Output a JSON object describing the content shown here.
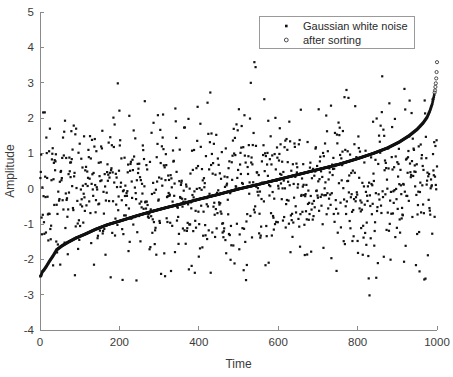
{
  "chart_data": {
    "type": "scatter",
    "title": "",
    "xlabel": "Time",
    "ylabel": "Amplitude",
    "xlim": [
      0,
      1000
    ],
    "ylim": [
      -4,
      5
    ],
    "xticks": [
      0,
      200,
      400,
      600,
      800,
      1000
    ],
    "yticks": [
      5,
      4,
      3,
      2,
      1,
      0,
      -1,
      -2,
      -3,
      -4
    ],
    "xticklabels": [
      "0",
      "200",
      "400",
      "600",
      "800",
      "1000"
    ],
    "yticklabels": [
      "5",
      "4",
      "3",
      "2",
      "1",
      "0",
      "-1",
      "-2",
      "-3",
      "-4"
    ],
    "grid": false,
    "legend_position": "top-right",
    "n_points": 1000,
    "series": [
      {
        "name": "Gaussian white noise",
        "marker": "filled-dot",
        "color": "#121212",
        "distribution": "normal",
        "mean": 0,
        "std": 1,
        "observed_min": -3.02,
        "observed_max": 3.58,
        "notable_outliers": [
          {
            "x": 540,
            "y": 3.58
          },
          {
            "x": 543,
            "y": 3.44
          },
          {
            "x": 862,
            "y": 3.18
          },
          {
            "x": 196,
            "y": 2.98
          },
          {
            "x": 830,
            "y": -3.02
          },
          {
            "x": 88,
            "y": -2.45
          },
          {
            "x": 330,
            "y": -2.33
          },
          {
            "x": 430,
            "y": -2.38
          }
        ]
      },
      {
        "name": "after sorting",
        "marker": "open-circle",
        "color": "#121212",
        "description": "same Gaussian samples sorted in ascending order",
        "start_value": -2.48,
        "end_value": 3.58,
        "midpoint_value": 0.0,
        "curve_points": [
          {
            "x": 1,
            "y": -2.48
          },
          {
            "x": 3,
            "y": -2.45
          },
          {
            "x": 6,
            "y": -2.35
          },
          {
            "x": 10,
            "y": -2.3
          },
          {
            "x": 16,
            "y": -2.2
          },
          {
            "x": 24,
            "y": -2.05
          },
          {
            "x": 33,
            "y": -1.9
          },
          {
            "x": 42,
            "y": -1.73
          },
          {
            "x": 55,
            "y": -1.62
          },
          {
            "x": 70,
            "y": -1.52
          },
          {
            "x": 90,
            "y": -1.4
          },
          {
            "x": 115,
            "y": -1.28
          },
          {
            "x": 140,
            "y": -1.15
          },
          {
            "x": 170,
            "y": -1.02
          },
          {
            "x": 200,
            "y": -0.92
          },
          {
            "x": 240,
            "y": -0.78
          },
          {
            "x": 280,
            "y": -0.65
          },
          {
            "x": 320,
            "y": -0.53
          },
          {
            "x": 360,
            "y": -0.42
          },
          {
            "x": 400,
            "y": -0.3
          },
          {
            "x": 450,
            "y": -0.16
          },
          {
            "x": 500,
            "y": -0.01
          },
          {
            "x": 550,
            "y": 0.12
          },
          {
            "x": 600,
            "y": 0.26
          },
          {
            "x": 650,
            "y": 0.4
          },
          {
            "x": 700,
            "y": 0.54
          },
          {
            "x": 750,
            "y": 0.68
          },
          {
            "x": 800,
            "y": 0.85
          },
          {
            "x": 840,
            "y": 1.0
          },
          {
            "x": 875,
            "y": 1.15
          },
          {
            "x": 905,
            "y": 1.32
          },
          {
            "x": 930,
            "y": 1.5
          },
          {
            "x": 950,
            "y": 1.68
          },
          {
            "x": 965,
            "y": 1.86
          },
          {
            "x": 975,
            "y": 2.02
          },
          {
            "x": 982,
            "y": 2.2
          },
          {
            "x": 988,
            "y": 2.4
          },
          {
            "x": 992,
            "y": 2.6
          },
          {
            "x": 995,
            "y": 2.78
          },
          {
            "x": 997,
            "y": 2.98
          },
          {
            "x": 998,
            "y": 3.12
          },
          {
            "x": 999,
            "y": 3.3
          },
          {
            "x": 1000,
            "y": 3.58
          }
        ]
      }
    ],
    "legend": [
      {
        "label": "Gaussian white noise",
        "marker": "filled-dot"
      },
      {
        "label": "after sorting",
        "marker": "open-circle"
      }
    ]
  },
  "axes": {
    "xlabel": "Time",
    "ylabel": "Amplitude"
  },
  "legend": {
    "entries": [
      {
        "label": "Gaussian white noise"
      },
      {
        "label": "after sorting"
      }
    ]
  }
}
